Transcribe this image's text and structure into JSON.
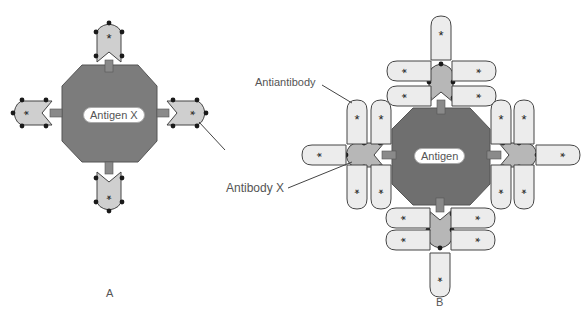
{
  "diagram": {
    "panel_a": {
      "label": "A",
      "antigen_label": "Antigen X",
      "antibody_label": "Antibody X"
    },
    "panel_b": {
      "label": "B",
      "antigen_label": "Antigen",
      "antiantibody_label": "Antiantibody"
    },
    "marker_glyph": "*",
    "colors": {
      "antigen": "#7c7c7c",
      "antibody": "#bdbdbd",
      "antiantibody": "#e6e6e6",
      "outline": "#444444",
      "dot": "#1a1a1a"
    }
  }
}
